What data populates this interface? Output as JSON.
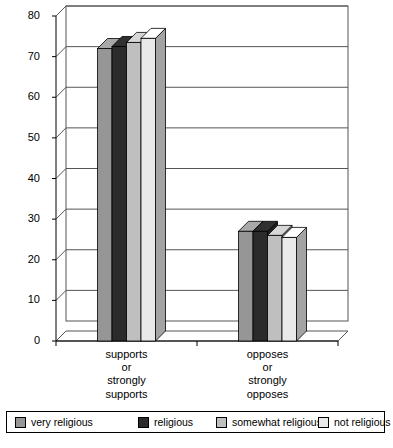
{
  "chart_data": {
    "type": "bar",
    "title": "",
    "subtitle": "",
    "xlabel": "",
    "ylabel": "",
    "ylim": [
      0,
      80
    ],
    "yticks": [
      0,
      10,
      20,
      30,
      40,
      50,
      60,
      70,
      80
    ],
    "ytick_labels": [
      "0",
      "10",
      "20",
      "30",
      "40",
      "50",
      "60",
      "70",
      "80"
    ],
    "grid": true,
    "grid_axis": "y",
    "legend_position": "bottom",
    "style": "3d-grouped-bar",
    "categories": [
      "supports\nor\nstrongly\nsupports",
      "opposes\nor\nstrongly\nopposes"
    ],
    "category_lines": [
      [
        "supports",
        "or",
        "strongly",
        "supports"
      ],
      [
        "opposes",
        "or",
        "strongly",
        "opposes"
      ]
    ],
    "series": [
      {
        "name": "very religious",
        "color": "#969696",
        "values": [
          72.0,
          27.0
        ]
      },
      {
        "name": "religious",
        "color": "#2b2b2b",
        "values": [
          72.5,
          27.0
        ]
      },
      {
        "name": "somewhat religious",
        "color": "#bfbfbf",
        "values": [
          73.5,
          26.0
        ]
      },
      {
        "name": "not religious",
        "color": "#e9e9e9",
        "values": [
          74.5,
          25.5
        ]
      }
    ]
  },
  "legend": {
    "items": [
      {
        "label": "very religious",
        "color": "#969696"
      },
      {
        "label": "religious",
        "color": "#2b2b2b"
      },
      {
        "label": "somewhat religious",
        "color": "#bfbfbf"
      },
      {
        "label": "not religious",
        "color": "#e9e9e9"
      }
    ]
  },
  "colors": {
    "axis": "#000000",
    "gridline": "#000000",
    "plot_background": "#ffffff",
    "side_face_shade": "0.78",
    "top_face_shade": "1.08"
  }
}
